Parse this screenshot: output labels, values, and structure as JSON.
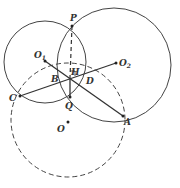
{
  "diagram": {
    "type": "geometry",
    "circles": [
      {
        "name": "circle-O1",
        "cx": 45,
        "cy": 62,
        "r": 41,
        "style": "solid"
      },
      {
        "name": "circle-O2",
        "cx": 114,
        "cy": 65,
        "r": 57,
        "style": "solid"
      },
      {
        "name": "circle-O",
        "cx": 68,
        "cy": 120,
        "r": 57,
        "style": "dashed"
      }
    ],
    "points": [
      {
        "id": "P",
        "label": "P",
        "x": 72,
        "y": 26,
        "lx": 70,
        "ly": 21
      },
      {
        "id": "O1",
        "label": "O",
        "sub": "1",
        "x": 45,
        "y": 61,
        "lx": 34,
        "ly": 58
      },
      {
        "id": "O2",
        "label": "O",
        "sub": "2",
        "x": 116,
        "y": 63,
        "lx": 119,
        "ly": 66
      },
      {
        "id": "B",
        "label": "B",
        "x": 57,
        "y": 71,
        "lx": 51,
        "ly": 82
      },
      {
        "id": "H",
        "label": "H",
        "x": 70,
        "y": 77,
        "lx": 71,
        "ly": 75
      },
      {
        "id": "D",
        "label": "D",
        "x": 87,
        "y": 72,
        "lx": 86,
        "ly": 84
      },
      {
        "id": "C",
        "label": "C",
        "x": 20,
        "y": 96,
        "lx": 9,
        "ly": 101
      },
      {
        "id": "Q",
        "label": "Q",
        "x": 70,
        "y": 97,
        "lx": 65,
        "ly": 109
      },
      {
        "id": "A",
        "label": "A",
        "x": 123,
        "y": 116,
        "lx": 124,
        "ly": 125
      },
      {
        "id": "O",
        "label": "O",
        "x": 68,
        "y": 122,
        "lx": 57,
        "ly": 132
      }
    ],
    "segments": [
      {
        "from": "O1",
        "to": "A",
        "style": "solid"
      },
      {
        "from": "C",
        "to": "O2",
        "style": "solid"
      },
      {
        "from": "P",
        "to": "H",
        "style": "dashed"
      },
      {
        "from": "H",
        "to": "Q",
        "style": "solid"
      }
    ],
    "right_angle_mark": {
      "at": "H"
    }
  }
}
